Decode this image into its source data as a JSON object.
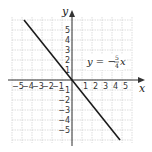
{
  "chart_data": {
    "type": "line",
    "title": "",
    "xlabel": "x",
    "ylabel": "y",
    "xlim": [
      -6,
      6
    ],
    "ylim": [
      -6.3,
      6.3
    ],
    "grid": true,
    "x_ticks": [
      -5,
      -4,
      -3,
      -2,
      -1,
      1,
      2,
      3,
      4,
      5
    ],
    "y_ticks": [
      5,
      4,
      3,
      2,
      1,
      -1,
      -2,
      -3,
      -4,
      -5
    ],
    "x_tick_labels": [
      "−5",
      "−4",
      "−3",
      "−2",
      "−1",
      "1",
      "2",
      "3",
      "4",
      "5"
    ],
    "y_tick_labels": [
      "5",
      "4",
      "3",
      "2",
      "1",
      "−1",
      "−2",
      "−3",
      "−4",
      "−5"
    ],
    "series": [
      {
        "name": "y = −(5/4)x",
        "slope": -1.25,
        "intercept": 0,
        "x": [
          -4.8,
          0,
          4.8
        ],
        "y": [
          6,
          0,
          -6
        ]
      }
    ],
    "annotations": [
      {
        "text": "y = −5/4 x",
        "x": 3.3,
        "y": 1.5
      }
    ],
    "legend": "none"
  },
  "labels": {
    "x_axis": "x",
    "y_axis": "y",
    "equation_lhs": "y = −",
    "equation_num": "5",
    "equation_den": "4",
    "equation_var": "x"
  },
  "colors": {
    "grid": "#c8c8c8",
    "axis": "#333333",
    "line": "#1a1a1a",
    "background": "#ffffff"
  }
}
